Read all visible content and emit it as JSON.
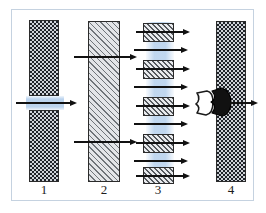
{
  "figure": {
    "frame_color": "#c5d2e0",
    "background": "#ffffff"
  },
  "colors": {
    "wall_outline": "#2b2b2b",
    "checker_dark": "#1f2329",
    "checker_light": "#cfd3d8",
    "hatch_line": "#6f7479",
    "flow_blue": "#b7d1ed",
    "arrow": "#111111",
    "key_fill_dark": "#111111",
    "key_fill_light": "#ffffff"
  },
  "panels": [
    {
      "id": "panel-1",
      "label": "1",
      "wall_pattern": "checkerboard",
      "description": "Single channel opening through a checkerboard barrier; one arrow passes through the gap",
      "arrow_count": 1,
      "blocked": false
    },
    {
      "id": "panel-2",
      "label": "2",
      "wall_pattern": "diagonal-hatch",
      "description": "Solid hatched barrier traversed by two arrows",
      "arrow_count": 2,
      "blocked": false
    },
    {
      "id": "panel-3",
      "label": "3",
      "wall_pattern": "segmented-hatch",
      "description": "Segmented barrier with five hatched blocks and eight arrows through a vertical flow band",
      "arrow_count": 8,
      "block_count": 5,
      "blocked": false
    },
    {
      "id": "panel-4",
      "label": "4",
      "wall_pattern": "checkerboard",
      "description": "Checkerboard barrier with a key-shaped gate; a light key approaches and a dark key is docked, one arrow exits",
      "arrow_count": 1,
      "key_shapes": [
        {
          "name": "approaching-key",
          "fill": "light"
        },
        {
          "name": "docked-key",
          "fill": "dark"
        }
      ],
      "blocked": false
    }
  ],
  "labels": {
    "panel_1": "1",
    "panel_2": "2",
    "panel_3": "3",
    "panel_4": "4"
  }
}
